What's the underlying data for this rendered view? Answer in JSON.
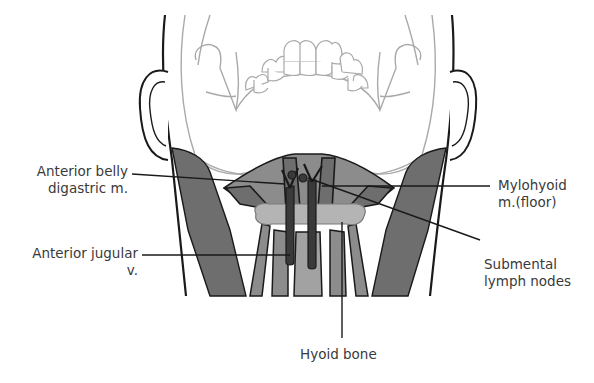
{
  "figure": {
    "type": "anatomical-diagram",
    "colors": {
      "outline": "#1a1a1a",
      "skull_line": "#a9a9a9",
      "muscle_dark": "#6e6e6e",
      "muscle_mid": "#8c8c8c",
      "hyoid": "#b4b4b4",
      "vein": "#3a3a3a",
      "text": "#3a3a3a"
    }
  },
  "labels": {
    "anterior_belly_digastric": {
      "line1": "Anterior belly",
      "line2": "digastric m."
    },
    "anterior_jugular": {
      "line1": "Anterior jugular",
      "line2": "v."
    },
    "mylohyoid": {
      "line1": "Mylohyoid",
      "line2": "m.(floor)"
    },
    "submental_lymph_nodes": {
      "line1": "Submental",
      "line2": "lymph nodes"
    },
    "hyoid_bone": {
      "line1": "Hyoid bone"
    }
  }
}
